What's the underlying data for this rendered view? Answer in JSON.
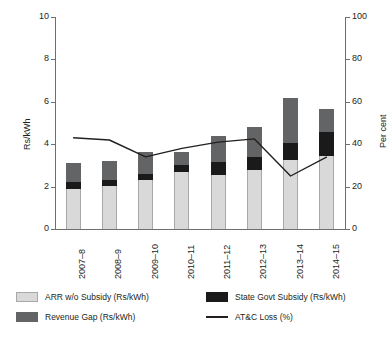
{
  "chart_data": {
    "type": "bar",
    "title": "",
    "subtitle": "",
    "xlabel": "",
    "ylabel": "Rs/kWh",
    "y2label": "Per cent",
    "ylim": [
      0,
      10
    ],
    "y2lim": [
      0,
      100
    ],
    "yticks": [
      "0",
      "2",
      "4",
      "6",
      "8",
      "10"
    ],
    "ytick_values": [
      0,
      2,
      4,
      6,
      8,
      10
    ],
    "y2ticks": [
      "0",
      "20",
      "40",
      "60",
      "80",
      "100"
    ],
    "y2tick_values": [
      0,
      20,
      40,
      60,
      80,
      100
    ],
    "grid": false,
    "stacked": true,
    "legend_position": "bottom",
    "categories": [
      "2007–8",
      "2008–9",
      "2009–10",
      "2010–11",
      "2011–12",
      "2012–13",
      "2013–14",
      "2014–15"
    ],
    "series": [
      {
        "name": "ARR w/o Subsidy (Rs/kWh)",
        "type": "bar",
        "axis": "left",
        "color": "#d9d9d9",
        "values": [
          1.88,
          2.02,
          2.33,
          2.68,
          2.57,
          2.8,
          3.25,
          3.43
        ]
      },
      {
        "name": "State Govt Subsidy (Rs/kWh)",
        "type": "bar",
        "axis": "left",
        "color": "#1a1a1a",
        "values": [
          0.35,
          0.3,
          0.28,
          0.35,
          0.6,
          0.62,
          0.8,
          1.13
        ]
      },
      {
        "name": "Revenue Gap (Rs/kWh)",
        "type": "bar",
        "axis": "left",
        "color": "#636466",
        "values": [
          0.88,
          0.88,
          1.0,
          0.6,
          1.22,
          1.4,
          2.15,
          1.12
        ]
      },
      {
        "name": "AT&C Loss (%)",
        "type": "line",
        "axis": "right",
        "color": "#231f20",
        "values": [
          43.0,
          42.0,
          34.0,
          38.0,
          41.0,
          42.5,
          25.0,
          34.0
        ]
      }
    ],
    "stack_totals": [
      3.11,
      3.2,
      3.61,
      3.63,
      4.39,
      4.82,
      6.2,
      5.68
    ]
  },
  "legend": {
    "items": [
      {
        "label": "ARR w/o Subsidy (Rs/kWh)",
        "marker": "square",
        "color": "#d9d9d9"
      },
      {
        "label": "State Govt Subsidy (Rs/kWh)",
        "marker": "square",
        "color": "#1a1a1a"
      },
      {
        "label": "Revenue Gap (Rs/kWh)",
        "marker": "square",
        "color": "#636466"
      },
      {
        "label": "AT&C Loss (%)",
        "marker": "line",
        "color": "#231f20"
      }
    ]
  }
}
